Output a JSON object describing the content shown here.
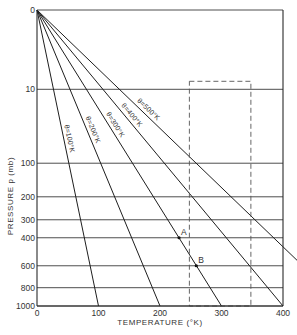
{
  "chart_data": {
    "type": "line",
    "title": "",
    "xlabel": "TEMPERATURE (°K)",
    "ylabel": "PRESSURE p (mb)",
    "xlim": [
      0,
      400
    ],
    "ylim": [
      0,
      1000
    ],
    "y_scale": "p^0.286 (inverted, 0 at top)",
    "x_ticks": [
      0,
      100,
      200,
      300,
      400
    ],
    "y_ticks": [
      0,
      10,
      100,
      200,
      300,
      400,
      600,
      800,
      1000
    ],
    "grid": "horizontal lines at y ticks",
    "series": [
      {
        "name": "θ=100°K",
        "theta": 100,
        "points": [
          [
            0,
            0
          ],
          [
            19.3,
            10
          ],
          [
            37.3,
            100
          ],
          [
            72,
            1000
          ]
        ]
      },
      {
        "name": "θ=200°K",
        "theta": 200,
        "points": [
          [
            0,
            0
          ],
          [
            38.6,
            10
          ],
          [
            74.6,
            100
          ],
          [
            144,
            1000
          ]
        ]
      },
      {
        "name": "θ=300°K",
        "theta": 300,
        "points": [
          [
            0,
            0
          ],
          [
            57.9,
            10
          ],
          [
            111.9,
            100
          ],
          [
            216,
            1000
          ]
        ]
      },
      {
        "name": "θ=400°K",
        "theta": 400,
        "points": [
          [
            0,
            0
          ],
          [
            77.2,
            10
          ],
          [
            149.2,
            100
          ],
          [
            288,
            1000
          ]
        ]
      },
      {
        "name": "θ=500°K",
        "theta": 500,
        "points": [
          [
            0,
            0
          ],
          [
            96.5,
            10
          ],
          [
            186.5,
            100
          ],
          [
            360,
            1000
          ]
        ]
      }
    ],
    "annotations": [
      {
        "label": "A",
        "T": 231,
        "p": 400
      },
      {
        "label": "B",
        "T": 259,
        "p": 600
      }
    ],
    "highlight_box": {
      "style": "dashed",
      "T_range": [
        225,
        325
      ],
      "p_range": [
        10,
        1000
      ]
    }
  },
  "labels": {
    "origin_y": "0",
    "origin_x": "0",
    "x_axis_title": "TEMPERATURE (°K)",
    "y_axis_title": "PRESSURE p (mb)"
  }
}
